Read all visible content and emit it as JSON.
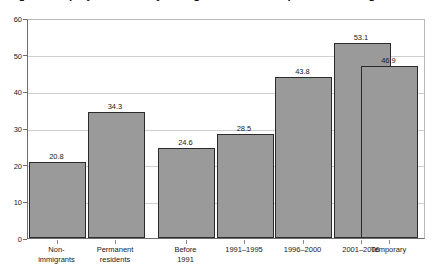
{
  "title": {
    "text": "Figure: Employment rate by immigrant status and period of immigration"
  },
  "chart_data": {
    "type": "bar",
    "title": "Figure: Employment rate by immigrant status and period of immigration",
    "xlabel": "",
    "ylabel": "",
    "ylim": [
      0,
      60
    ],
    "ytick_values": [
      0,
      10,
      20,
      30,
      40,
      50,
      60
    ],
    "ytick_labels": [
      "0",
      "10",
      "20",
      "30",
      "40",
      "50",
      "60"
    ],
    "grid": true,
    "grid_axis": "y",
    "legend": "none",
    "bar_color": "#9a9a9a",
    "bar_border_color": "#2b2b2b",
    "categories": [
      "Non-immigrants",
      "Permanent residents",
      "Before 1991",
      "1991–1995",
      "1996–2000",
      "2001–2006",
      "Temporary"
    ],
    "category_labels": [
      "Non-\nimmigrants",
      "Permanent\nresidents",
      "Before\n1991",
      "1991–1995",
      "1996–2000",
      "2001–2006",
      "Temporary"
    ],
    "values": [
      20.8,
      34.3,
      24.6,
      28.5,
      43.8,
      53.1,
      46.9
    ],
    "value_labels": [
      "20.8",
      "34.3",
      "24.6",
      "28.5",
      "43.8",
      "53.1",
      "46.9"
    ],
    "groups": [
      {
        "name": "group-1",
        "category_indices": [
          0,
          1
        ]
      },
      {
        "name": "group-2",
        "category_indices": [
          2,
          3,
          4,
          5
        ]
      },
      {
        "name": "group-3",
        "category_indices": [
          6
        ]
      }
    ]
  }
}
